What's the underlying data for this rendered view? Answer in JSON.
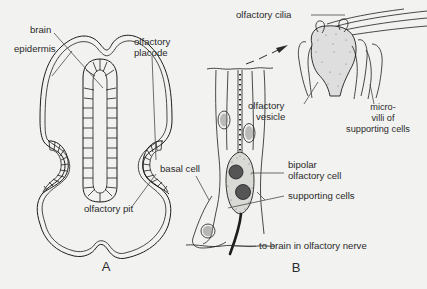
{
  "figure": {
    "kind": "anatomical-line-drawing",
    "background_color": "#f2f2f0",
    "ink_color": "#1d1d1d"
  },
  "panels": [
    {
      "letter": "A",
      "name": "transverse-section-of-head",
      "labels": [
        {
          "id": "brain",
          "text": "brain"
        },
        {
          "id": "epidermis",
          "text": "epidermis"
        },
        {
          "id": "olfactory-placode",
          "text": "olfactory\nplacode",
          "line1": "olfactory",
          "line2": "placode"
        },
        {
          "id": "olfactory-pit",
          "text": "olfactory pit"
        }
      ]
    },
    {
      "letter": "B",
      "name": "olfactory-epithelium",
      "labels": [
        {
          "id": "olfactory-cilia",
          "text": "olfactory cilia"
        },
        {
          "id": "olfactory-vesicle",
          "text": "olfactory\nvesicle",
          "line1": "olfactory",
          "line2": "vesicle"
        },
        {
          "id": "microvilli",
          "text": "micro-villi of supporting cells",
          "line1": "micro-",
          "line2": "villi of",
          "line3": "supporting cells"
        },
        {
          "id": "bipolar-olfactory-cell",
          "text": "bipolar\nolfactory cell",
          "line1": "bipolar",
          "line2": "olfactory cell"
        },
        {
          "id": "supporting-cells",
          "text": "supporting cells"
        },
        {
          "id": "basal-cell",
          "text": "basal cell"
        },
        {
          "id": "olfactory-nerve",
          "text": "to brain in olfactory nerve"
        }
      ]
    }
  ]
}
